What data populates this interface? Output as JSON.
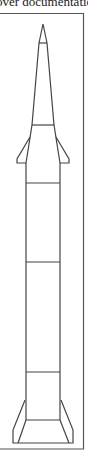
{
  "caption": {
    "text": "over documentation"
  },
  "figure": {
    "stroke_color": "#444444",
    "frame_color": "#555555",
    "frame": {
      "x1": 0,
      "y1": 13.5,
      "x2": 83.5,
      "y2": 449
    },
    "nose": {
      "tip": [
        43,
        24
      ],
      "crossbar_y": 43,
      "crossbar_x": [
        39,
        47
      ]
    },
    "upper_stage": {
      "top_x": [
        39,
        47
      ],
      "bottom_y": 125,
      "bottom_x": [
        32,
        54
      ]
    },
    "body": {
      "x": [
        26,
        60
      ],
      "top_y": 163,
      "bottom_y": 444
    },
    "section_lines_y": [
      183,
      262,
      372
    ],
    "upper_fins": {
      "start_y": 137,
      "tip_y": 162,
      "outer_x": [
        17,
        69
      ],
      "root_x": [
        31,
        55
      ]
    },
    "lower_fins": {
      "start_y": 400,
      "outer_x": [
        13,
        73
      ],
      "bottom_y": 441
    }
  }
}
